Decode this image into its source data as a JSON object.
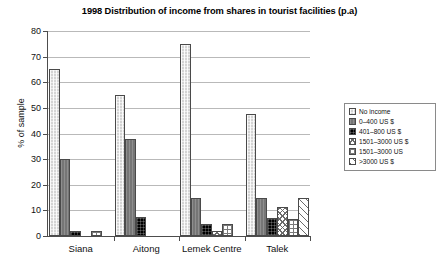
{
  "chart_data": {
    "type": "bar",
    "title": "1998 Distribution of income from shares in tourist facilities (p.a)",
    "xlabel": "",
    "ylabel": "% of sample",
    "ylim": [
      0,
      80
    ],
    "yticks": [
      0,
      10,
      20,
      30,
      40,
      50,
      60,
      70,
      80
    ],
    "ytick_labels": [
      "0",
      "10",
      "20",
      "30",
      "40",
      "50",
      "60",
      "70",
      "80"
    ],
    "grid": true,
    "legend_position": "right",
    "categories": [
      "Siana",
      "Aitong",
      "Lemek Centre",
      "Talek"
    ],
    "series": [
      {
        "name": "No income",
        "pattern": "light-gray",
        "color": "#d4d4d4",
        "values": [
          65,
          55,
          75,
          47.5
        ]
      },
      {
        "name": "0–400 US $",
        "pattern": "mid-gray",
        "color": "#767676",
        "values": [
          30,
          38,
          15,
          15
        ]
      },
      {
        "name": "401–800 US $",
        "pattern": "black",
        "color": "#000000",
        "values": [
          2,
          7.5,
          4.5,
          7
        ]
      },
      {
        "name": "1501–3000 US $",
        "pattern": "cross-hatch",
        "color": "#ffffff",
        "values": [
          0,
          0,
          2,
          11.5
        ]
      },
      {
        "name": "1501–3000 US",
        "pattern": "grid",
        "color": "#ffffff",
        "values": [
          2,
          0,
          4.5,
          6.5
        ]
      },
      {
        "name": ">3000 US $",
        "pattern": "diagonal",
        "color": "#ffffff",
        "values": [
          0,
          0,
          0,
          15
        ]
      }
    ]
  },
  "legend": {
    "items": [
      {
        "label": "No income"
      },
      {
        "label": "0–400 US $"
      },
      {
        "label": "401–800 US $"
      },
      {
        "label": "1501–3000 US $"
      },
      {
        "label": "1501–3000 US"
      },
      {
        "label": ">3000 US $"
      }
    ]
  }
}
